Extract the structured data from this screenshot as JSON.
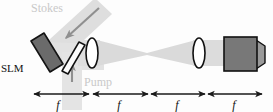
{
  "figure": {
    "background_color": "#fdfdfd"
  },
  "labels": {
    "stokes": "Stokes",
    "pump": "Pump",
    "slm": "SLM",
    "focal_1": "f",
    "focal_2": "f",
    "focal_3": "f",
    "focal_4": "f"
  },
  "colors": {
    "beam_gray": "#d9d9d9",
    "beam_gray_light": "#e4e4e4",
    "slm_body": "#6b6b6b",
    "slm_outline": "#141414",
    "beamsplitter_body": "#fbfbfb",
    "beamsplitter_outline": "#111111",
    "lens_fill": "#ffffff",
    "lens_outline": "#111111",
    "detector_face": "#787878",
    "detector_side": "#9a9a9a",
    "detector_outline": "#111111",
    "ruler_line": "#1a1a1a",
    "label_faint": "#c9c9c9",
    "label_dark": "#111111",
    "arrow_gray": "#8f8f8f"
  },
  "components": [
    {
      "name": "slm",
      "label": "SLM",
      "kind": "spatial-light-modulator"
    },
    {
      "name": "beam-splitter",
      "label": "",
      "kind": "dichroic-mirror"
    },
    {
      "name": "lens-1",
      "label": "",
      "kind": "lens"
    },
    {
      "name": "focus-point",
      "label": "",
      "kind": "focal-plane"
    },
    {
      "name": "lens-2",
      "label": "",
      "kind": "lens"
    },
    {
      "name": "detector",
      "label": "",
      "kind": "camera"
    }
  ],
  "beams": [
    {
      "name": "stokes-beam",
      "label": "Stokes",
      "direction": "down-left"
    },
    {
      "name": "pump-beam",
      "label": "Pump",
      "direction": "up"
    },
    {
      "name": "output-beam",
      "label": "",
      "direction": "right"
    }
  ],
  "ruler": {
    "segments": [
      {
        "label": "f",
        "x_start": 34,
        "x_end": 89
      },
      {
        "label": "f",
        "x_start": 93,
        "x_end": 148
      },
      {
        "label": "f",
        "x_start": 151,
        "x_end": 205
      },
      {
        "label": "f",
        "x_start": 208,
        "x_end": 262
      }
    ],
    "y": 94
  }
}
